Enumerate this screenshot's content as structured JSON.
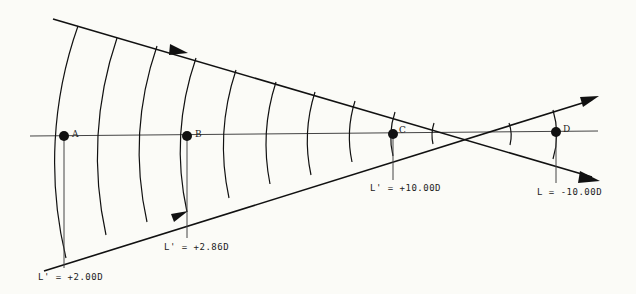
{
  "diagram": {
    "type": "converging-wavefront-vergence",
    "focus": {
      "x": 472,
      "y": 134
    },
    "axis": {
      "y": 135,
      "x1": 30,
      "x2": 598
    },
    "rays": [
      {
        "name": "upper-ray",
        "x1": 53,
        "y1": 19,
        "x2": 597,
        "y2": 179,
        "arrows": [
          [
            185,
            53
          ],
          [
            597,
            179
          ]
        ]
      },
      {
        "name": "lower-ray",
        "x1": 44,
        "y1": 271,
        "x2": 597,
        "y2": 98,
        "arrows": [
          [
            187,
            212
          ],
          [
            597,
            98
          ]
        ]
      }
    ],
    "wavefront_x": [
      64,
      106,
      147,
      187,
      229,
      270,
      311,
      352,
      393,
      433,
      510,
      556
    ],
    "points": [
      {
        "id": "A",
        "label": "A",
        "x": 64,
        "y": 136
      },
      {
        "id": "B",
        "label": "B",
        "x": 187,
        "y": 136
      },
      {
        "id": "C",
        "label": "C",
        "x": 393,
        "y": 134
      },
      {
        "id": "D",
        "label": "D",
        "x": 556,
        "y": 132
      }
    ],
    "annotations": [
      {
        "point": "A",
        "text": "L' = +2.00D",
        "x": 38,
        "y": 278,
        "line_to": 268
      },
      {
        "point": "B",
        "text": "L' = +2.86D",
        "x": 164,
        "y": 249,
        "line_to": 238
      },
      {
        "point": "C",
        "text": "L' = +10.00D",
        "x": 370,
        "y": 191,
        "line_to": 180
      },
      {
        "point": "D",
        "text": "L = -10.00D",
        "x": 537,
        "y": 194,
        "line_to": 183
      }
    ]
  },
  "labels": {
    "A": "A",
    "B": "B",
    "C": "C",
    "D": "D",
    "ann_A": "L' = +2.00D",
    "ann_B": "L' = +2.86D",
    "ann_C": "L' = +10.00D",
    "ann_D": "L = -10.00D"
  }
}
